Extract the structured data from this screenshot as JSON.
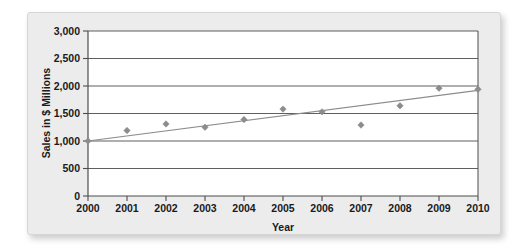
{
  "figure": {
    "panel_background": "#ececed",
    "plot_background": "#ffffff"
  },
  "chart_data": {
    "type": "scatter",
    "title": "",
    "xlabel": "Year",
    "ylabel": "Sales in $ Millions",
    "x": [
      2000,
      2001,
      2002,
      2003,
      2004,
      2005,
      2006,
      2007,
      2008,
      2009,
      2010
    ],
    "xtick_labels": [
      "2000",
      "2001",
      "2002",
      "2003",
      "2004",
      "2005",
      "2006",
      "2007",
      "2008",
      "2009",
      "2010"
    ],
    "ytick_values": [
      0,
      500,
      1000,
      1500,
      2000,
      2500,
      3000
    ],
    "ytick_labels": [
      "0",
      "500",
      "1,000",
      "1,500",
      "2,000",
      "2,500",
      "3,000"
    ],
    "xlim": [
      2000,
      2010
    ],
    "ylim": [
      0,
      3000
    ],
    "grid": "horizontal",
    "legend": "none",
    "series": [
      {
        "name": "Sales",
        "kind": "scatter",
        "marker": "diamond",
        "color": "#8c8c8c",
        "values": [
          1000,
          1190,
          1310,
          1250,
          1390,
          1580,
          1530,
          1290,
          1640,
          1960,
          1940
        ]
      },
      {
        "name": "Trend line",
        "kind": "line",
        "color": "#8c8c8c",
        "endpoints": [
          {
            "x": 2000,
            "y": 1000
          },
          {
            "x": 2010,
            "y": 1920
          }
        ]
      }
    ]
  }
}
